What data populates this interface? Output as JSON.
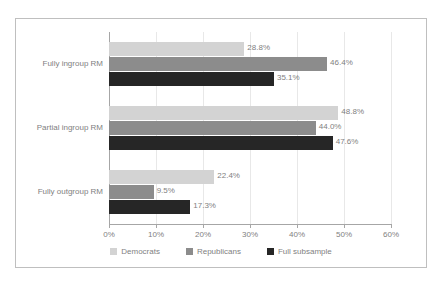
{
  "chart_data": {
    "type": "bar",
    "orientation": "horizontal",
    "title": "",
    "xlabel": "",
    "ylabel": "",
    "xlim": [
      0,
      60
    ],
    "xtick_labels": [
      "0%",
      "10%",
      "20%",
      "30%",
      "40%",
      "50%",
      "60%"
    ],
    "xticks": [
      0,
      10,
      20,
      30,
      40,
      50,
      60
    ],
    "grid": true,
    "legend_position": "bottom",
    "categories": [
      "Fully ingroup RM",
      "Partial ingroup RM",
      "Fully outgroup RM"
    ],
    "series": [
      {
        "name": "Democrats",
        "color": "#d3d3d3",
        "values": [
          28.8,
          48.8,
          22.4
        ],
        "labels": [
          "28.8%",
          "48.8%",
          "22.4%"
        ]
      },
      {
        "name": "Republicans",
        "color": "#8c8c8c",
        "values": [
          46.4,
          44.0,
          9.5
        ],
        "labels": [
          "46.4%",
          "44.0%",
          "9.5%"
        ]
      },
      {
        "name": "Full subsample",
        "color": "#262626",
        "values": [
          35.1,
          47.6,
          17.3
        ],
        "labels": [
          "35.1%",
          "47.6%",
          "17.3%"
        ]
      }
    ]
  },
  "legend": {
    "items": [
      {
        "label": "Democrats",
        "color": "#d3d3d3"
      },
      {
        "label": "Republicans",
        "color": "#8c8c8c"
      },
      {
        "label": "Full subsample",
        "color": "#262626"
      }
    ]
  },
  "axis": {
    "x_ticks": [
      {
        "label": "0%",
        "value": 0
      },
      {
        "label": "10%",
        "value": 10
      },
      {
        "label": "20%",
        "value": 20
      },
      {
        "label": "30%",
        "value": 30
      },
      {
        "label": "40%",
        "value": 40
      },
      {
        "label": "50%",
        "value": 50
      },
      {
        "label": "60%",
        "value": 60
      }
    ],
    "y_categories": [
      "Fully ingroup RM",
      "Partial ingroup RM",
      "Fully outgroup RM"
    ]
  },
  "colors": {
    "frame_border": "#bfbfbf",
    "gridline": "#e8e8e8",
    "axis": "#a6a6a6",
    "text": "#7f7f7f",
    "background": "#ffffff"
  }
}
